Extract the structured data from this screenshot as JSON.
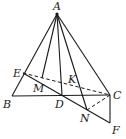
{
  "diagram": {
    "type": "geometry",
    "points": {
      "A": {
        "label": "A",
        "x": 57,
        "y": 14
      },
      "B": {
        "label": "B",
        "x": 12,
        "y": 96
      },
      "C": {
        "label": "C",
        "x": 110,
        "y": 95
      },
      "D": {
        "label": "D",
        "x": 62,
        "y": 95
      },
      "E": {
        "label": "E",
        "x": 23,
        "y": 73
      },
      "F": {
        "label": "F",
        "x": 110,
        "y": 123
      },
      "M": {
        "label": "M",
        "x": 42,
        "y": 78
      },
      "K": {
        "label": "K",
        "x": 79,
        "y": 86
      },
      "N": {
        "label": "N",
        "x": 87,
        "y": 110
      }
    },
    "solid_segments": [
      [
        "A",
        "B"
      ],
      [
        "A",
        "C"
      ],
      [
        "A",
        "D"
      ],
      [
        "A",
        "M"
      ],
      [
        "A",
        "N"
      ],
      [
        "B",
        "C"
      ],
      [
        "E",
        "F"
      ],
      [
        "C",
        "F"
      ]
    ],
    "dashed_segments": [
      [
        "E",
        "C"
      ],
      [
        "C",
        "N"
      ]
    ]
  }
}
